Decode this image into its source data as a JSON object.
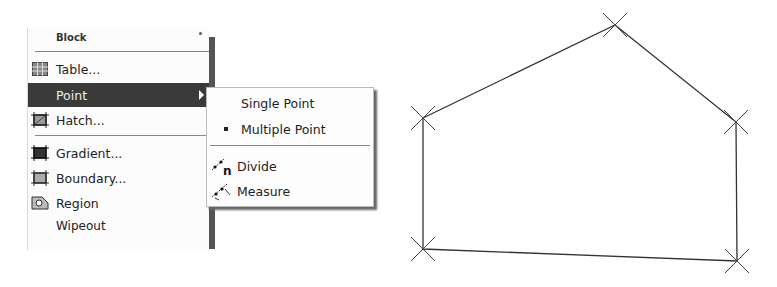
{
  "menu": {
    "items": [
      {
        "label": "Block",
        "icon": "none",
        "submenu": true,
        "partial": true
      },
      {
        "label": "Table...",
        "icon": "table-icon"
      },
      {
        "label": "Point",
        "icon": "none",
        "submenu": true,
        "highlighted": true
      },
      {
        "label": "Hatch...",
        "icon": "hatch-icon"
      },
      {
        "label": "Gradient...",
        "icon": "gradient-icon"
      },
      {
        "label": "Boundary...",
        "icon": "boundary-icon"
      },
      {
        "label": "Region",
        "icon": "region-icon"
      },
      {
        "label": "Wipeout",
        "icon": "none",
        "partial": true
      }
    ]
  },
  "submenu": {
    "items": [
      {
        "label": "Single Point",
        "icon": "none"
      },
      {
        "label": "Multiple Point",
        "icon": "bullet-icon"
      },
      {
        "label": "Divide",
        "icon": "divide-icon"
      },
      {
        "label": "Measure",
        "icon": "measure-icon"
      }
    ]
  },
  "drawing": {
    "points": [
      [
        423,
        118
      ],
      [
        615,
        25
      ],
      [
        736,
        122
      ],
      [
        737,
        261
      ],
      [
        423,
        249
      ]
    ],
    "marker": "x-point-marker",
    "stroke_color": "#333333"
  }
}
